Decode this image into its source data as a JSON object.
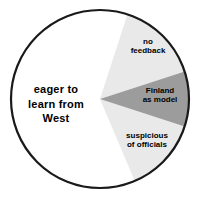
{
  "figure": {
    "background_color": "#ffffff",
    "outline_color": "#1a1a1a",
    "width": 202,
    "height": 205
  },
  "chart_data": {
    "type": "pie",
    "title": "",
    "subtitle": "",
    "xlabel": "",
    "ylabel": "",
    "legend_position": "none",
    "grid": false,
    "labels_inside_slices": true,
    "center": {
      "x": 100,
      "y": 99
    },
    "radius": 90,
    "categories": [
      "eager to learn from West",
      "no feedback",
      "Finland as model",
      "suspicious of officials"
    ],
    "values": [
      61,
      15,
      10,
      14
    ],
    "series": [
      {
        "name": "attitudes",
        "values": [
          61,
          15,
          10,
          14
        ]
      }
    ],
    "slices": [
      {
        "id": "eager",
        "label": "eager to\nlearn from\nWest",
        "label_plain": "eager to learn from West",
        "value": 61,
        "fill": "#ffffff",
        "text_color": "#000000",
        "start_angle_deg": 72,
        "end_angle_deg": 293,
        "emphasis": "bold-large"
      },
      {
        "id": "no-feedback",
        "label": "no\nfeedback",
        "label_plain": "no feedback",
        "value": 15,
        "fill": "#e9e9e9",
        "text_color": "#000000",
        "start_angle_deg": 18,
        "end_angle_deg": 72,
        "emphasis": "small"
      },
      {
        "id": "finland",
        "label": "Finland\nas model",
        "label_plain": "Finland as model",
        "value": 10,
        "fill": "#9c9c9c",
        "text_color": "#000000",
        "start_angle_deg": -18,
        "end_angle_deg": 18,
        "emphasis": "small"
      },
      {
        "id": "suspicious",
        "label": "suspicious\nof officials",
        "label_plain": "suspicious of officials",
        "value": 14,
        "fill": "#e9e9e9",
        "text_color": "#000000",
        "start_angle_deg": -67,
        "end_angle_deg": -18,
        "emphasis": "small"
      }
    ],
    "colors": {
      "slice_white": "#ffffff",
      "slice_light_gray": "#e9e9e9",
      "slice_mid_gray": "#9c9c9c",
      "outline": "#1a1a1a",
      "text": "#000000"
    }
  }
}
